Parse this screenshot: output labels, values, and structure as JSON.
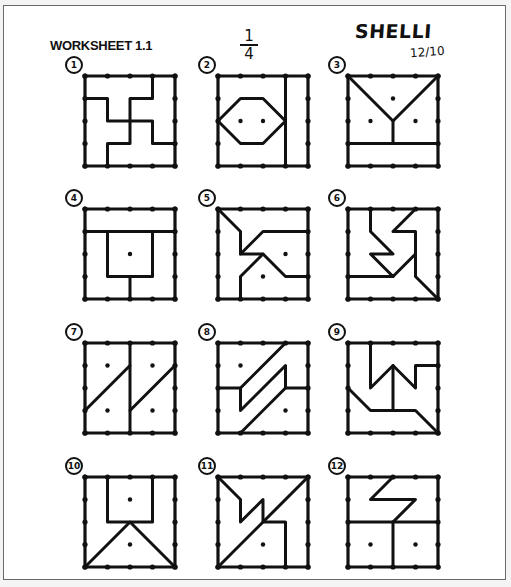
{
  "header": {
    "title": "WORKSHEET 1.1",
    "fraction_numerator": "1",
    "fraction_denominator": "4",
    "student_name": "SHELLI",
    "date": "12/10"
  },
  "style": {
    "ink": "#111111",
    "paper": "#ffffff",
    "frame": "#6a6a6a"
  },
  "grid": {
    "units": 4,
    "box_size_px": 90,
    "columns_x": [
      85,
      218,
      348
    ],
    "rows_y": [
      76,
      209,
      343,
      477
    ]
  },
  "puzzles": [
    {
      "number": "1",
      "col": 0,
      "row": 0,
      "dots": [],
      "lines": [
        [
          [
            0,
            1
          ],
          [
            1,
            1
          ],
          [
            1,
            2
          ],
          [
            2,
            2
          ],
          [
            2,
            1
          ],
          [
            3,
            1
          ],
          [
            3,
            0
          ]
        ],
        [
          [
            2,
            2
          ],
          [
            3,
            2
          ],
          [
            3,
            3
          ],
          [
            4,
            3
          ]
        ],
        [
          [
            2,
            2
          ],
          [
            2,
            3
          ],
          [
            1,
            3
          ],
          [
            1,
            4
          ]
        ]
      ]
    },
    {
      "number": "2",
      "col": 1,
      "row": 0,
      "dots": [
        [
          1,
          2
        ],
        [
          2,
          2
        ]
      ],
      "lines": [
        [
          [
            3,
            0
          ],
          [
            3,
            4
          ]
        ],
        [
          [
            0,
            2
          ],
          [
            1,
            1
          ],
          [
            2,
            1
          ],
          [
            3,
            2
          ],
          [
            2,
            3
          ],
          [
            1,
            3
          ],
          [
            0,
            2
          ]
        ]
      ]
    },
    {
      "number": "3",
      "col": 2,
      "row": 0,
      "dots": [
        [
          2,
          1
        ],
        [
          1,
          2
        ],
        [
          3,
          2
        ]
      ],
      "lines": [
        [
          [
            0,
            0
          ],
          [
            1,
            1
          ],
          [
            2,
            2
          ],
          [
            4,
            0
          ]
        ],
        [
          [
            2,
            2
          ],
          [
            2,
            3
          ]
        ],
        [
          [
            0,
            3
          ],
          [
            4,
            3
          ]
        ]
      ]
    },
    {
      "number": "4",
      "col": 0,
      "row": 1,
      "dots": [
        [
          2,
          2
        ]
      ],
      "lines": [
        [
          [
            0,
            1
          ],
          [
            4,
            1
          ]
        ],
        [
          [
            1,
            1
          ],
          [
            1,
            3
          ],
          [
            3,
            3
          ],
          [
            3,
            1
          ]
        ],
        [
          [
            2,
            3
          ],
          [
            2,
            4
          ]
        ]
      ]
    },
    {
      "number": "5",
      "col": 1,
      "row": 1,
      "dots": [
        [
          3,
          2
        ],
        [
          2,
          3
        ]
      ],
      "lines": [
        [
          [
            0,
            0
          ],
          [
            1,
            1
          ],
          [
            1,
            2
          ],
          [
            2,
            1
          ],
          [
            4,
            1
          ]
        ],
        [
          [
            1,
            2
          ],
          [
            2,
            2
          ],
          [
            3,
            3
          ],
          [
            4,
            3
          ]
        ],
        [
          [
            2,
            2
          ],
          [
            1,
            3
          ],
          [
            1,
            4
          ]
        ]
      ]
    },
    {
      "number": "6",
      "col": 2,
      "row": 1,
      "dots": [],
      "lines": [
        [
          [
            1,
            0
          ],
          [
            1,
            1
          ],
          [
            2,
            2
          ],
          [
            1,
            2
          ],
          [
            2,
            3
          ],
          [
            3,
            2
          ],
          [
            3,
            1
          ],
          [
            2,
            1
          ],
          [
            3,
            0
          ]
        ],
        [
          [
            0,
            3
          ],
          [
            2,
            3
          ]
        ],
        [
          [
            3,
            2
          ],
          [
            3,
            3
          ],
          [
            4,
            4
          ]
        ]
      ]
    },
    {
      "number": "7",
      "col": 0,
      "row": 2,
      "dots": [
        [
          1,
          1
        ],
        [
          3,
          1
        ],
        [
          1,
          3
        ],
        [
          3,
          3
        ]
      ],
      "lines": [
        [
          [
            2,
            0
          ],
          [
            2,
            4
          ]
        ],
        [
          [
            0,
            3
          ],
          [
            2,
            1
          ]
        ],
        [
          [
            2,
            3
          ],
          [
            4,
            1
          ]
        ]
      ]
    },
    {
      "number": "8",
      "col": 1,
      "row": 2,
      "dots": [
        [
          1,
          1
        ],
        [
          3,
          3
        ]
      ],
      "lines": [
        [
          [
            0,
            2
          ],
          [
            1,
            2
          ],
          [
            2,
            1
          ],
          [
            3,
            0
          ]
        ],
        [
          [
            1,
            2
          ],
          [
            1,
            3
          ],
          [
            3,
            1
          ],
          [
            3,
            2
          ],
          [
            4,
            2
          ]
        ],
        [
          [
            3,
            2
          ],
          [
            1,
            4
          ]
        ]
      ]
    },
    {
      "number": "9",
      "col": 2,
      "row": 2,
      "dots": [],
      "lines": [
        [
          [
            1,
            0
          ],
          [
            1,
            2
          ],
          [
            2,
            1
          ],
          [
            3,
            2
          ],
          [
            3,
            1
          ],
          [
            4,
            1
          ]
        ],
        [
          [
            2,
            1
          ],
          [
            2,
            3
          ]
        ],
        [
          [
            0,
            2
          ],
          [
            1,
            3
          ],
          [
            3,
            3
          ],
          [
            4,
            4
          ]
        ]
      ]
    },
    {
      "number": "10",
      "col": 0,
      "row": 3,
      "dots": [
        [
          2,
          1
        ],
        [
          2,
          3
        ]
      ],
      "lines": [
        [
          [
            1,
            0
          ],
          [
            1,
            2
          ],
          [
            3,
            2
          ],
          [
            3,
            0
          ]
        ],
        [
          [
            0,
            4
          ],
          [
            2,
            2
          ],
          [
            4,
            4
          ]
        ]
      ]
    },
    {
      "number": "11",
      "col": 1,
      "row": 3,
      "dots": [
        [
          2,
          3
        ]
      ],
      "lines": [
        [
          [
            0,
            0
          ],
          [
            1,
            1
          ],
          [
            1,
            2
          ],
          [
            2,
            1
          ],
          [
            2,
            2
          ],
          [
            3,
            2
          ],
          [
            3,
            4
          ]
        ],
        [
          [
            0,
            4
          ],
          [
            4,
            0
          ]
        ]
      ]
    },
    {
      "number": "12",
      "col": 2,
      "row": 3,
      "dots": [
        [
          1,
          3
        ],
        [
          3,
          3
        ]
      ],
      "lines": [
        [
          [
            2,
            0
          ],
          [
            1,
            1
          ],
          [
            3,
            1
          ],
          [
            2,
            2
          ]
        ],
        [
          [
            0,
            2
          ],
          [
            4,
            2
          ]
        ],
        [
          [
            2,
            2
          ],
          [
            2,
            4
          ]
        ]
      ]
    }
  ]
}
